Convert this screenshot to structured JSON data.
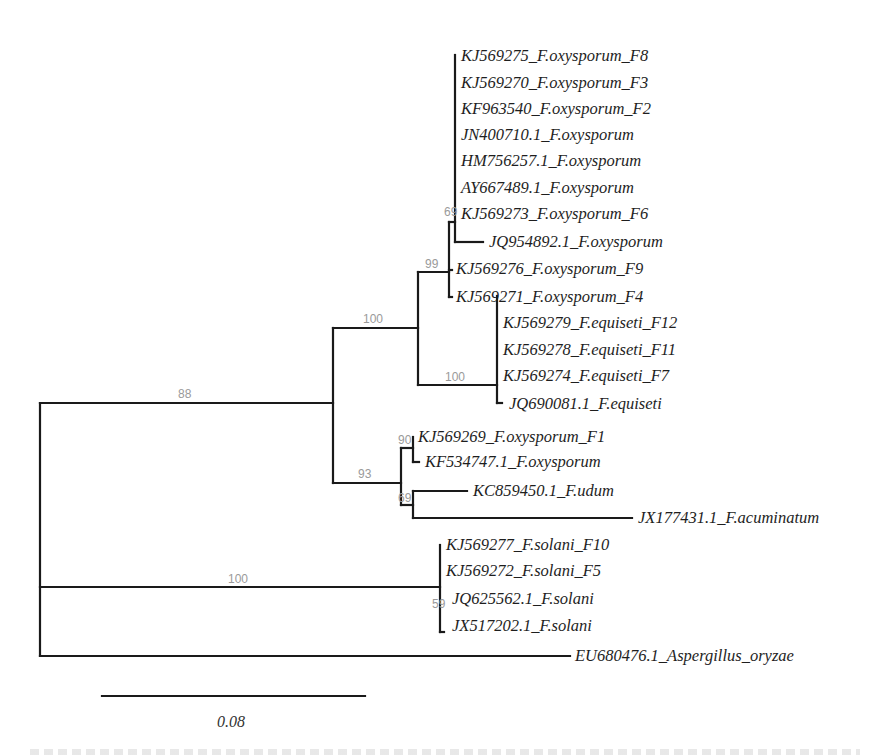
{
  "diagram": {
    "type": "phylogenetic-tree",
    "scale_bar": {
      "label": "0.08"
    },
    "taxa": [
      "KJ569275_F.oxysporum_F8",
      "KJ569270_F.oxysporum_F3",
      "KF963540_F.oxysporum_F2",
      "JN400710.1_F.oxysporum",
      "HM756257.1_F.oxysporum",
      "AY667489.1_F.oxysporum",
      "KJ569273_F.oxysporum_F6",
      "JQ954892.1_F.oxysporum",
      "KJ569276_F.oxysporum_F9",
      "KJ569271_F.oxysporum_F4",
      "KJ569279_F.equiseti_F12",
      "KJ569278_F.equiseti_F11",
      "KJ569274_F.equiseti_F7",
      "JQ690081.1_F.equiseti",
      "KJ569269_F.oxysporum_F1",
      "KF534747.1_F.oxysporum",
      "KC859450.1_F.udum",
      "JX177431.1_F.acuminatum",
      "KJ569277_F.solani_F10",
      "KJ569272_F.solani_F5",
      "JQ625562.1_F.solani",
      "JX517202.1_F.solani",
      "EU680476.1_Aspergillus_oryzae"
    ],
    "bootstrap": {
      "root_fusarium": "88",
      "oxy_equiseti": "100",
      "oxysporum_clade": "99",
      "oxysporum_subclade": "69",
      "equiseti_clade": "100",
      "mixed_clade": "93",
      "f1_pair": "90",
      "udum_acuminatum": "69",
      "solani_branch": "100",
      "solani_clade": "59"
    }
  }
}
